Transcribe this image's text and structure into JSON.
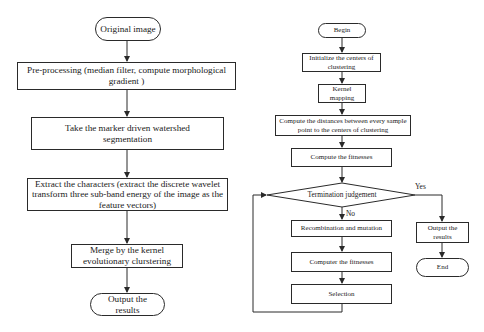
{
  "left_flowchart": {
    "start": "Original image",
    "steps": [
      "Pre-processing (median filter, compute morphological gradient )",
      "Take the marker driven watershed segmentation",
      "Extract the characters (extract the discrete wavelet transform three sub-band energy of the image as the feature vectors)",
      "Merge by the kernel evolutionary clurstering"
    ],
    "end": "Output the results"
  },
  "right_flowchart": {
    "start": "Begin",
    "steps": [
      "Initialize the centers of clustering",
      "Kernel mapping",
      "Compute the distances between every sample point to the centers of clustering",
      "Compute the fitnesses"
    ],
    "decision": "Termination judgement",
    "decision_yes": "Yes",
    "decision_no": "No",
    "loop_steps": [
      "Recombination and mutation",
      "Computer the fitnesses",
      "Selection"
    ],
    "yes_steps": [
      "Output the results"
    ],
    "end": "End"
  },
  "colors": {
    "line": "#2a2a2a",
    "background": "#ffffff"
  }
}
